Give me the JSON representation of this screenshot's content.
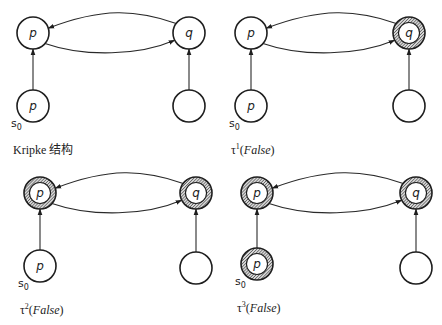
{
  "figure": {
    "panels": [
      {
        "id": "kripke",
        "caption": "Kripke 结构",
        "caption_parts": {
          "prefix": "Kripke 结构",
          "sup": "",
          "arg": ""
        },
        "origin": [
          0,
          0
        ],
        "nodes": [
          {
            "id": "s0",
            "label": "p",
            "x": 33,
            "y": 106,
            "marked": false,
            "initial": true
          },
          {
            "id": "s1",
            "label": "p",
            "x": 33,
            "y": 33,
            "marked": false
          },
          {
            "id": "s2",
            "label": "q",
            "x": 189,
            "y": 33,
            "marked": false
          },
          {
            "id": "s3",
            "label": "",
            "x": 189,
            "y": 106,
            "marked": false
          }
        ]
      },
      {
        "id": "tau1",
        "caption": "τ1(False)",
        "caption_parts": {
          "prefix": "τ",
          "sup": "1",
          "arg": "False"
        },
        "origin": [
          218,
          0
        ],
        "nodes": [
          {
            "id": "s0",
            "label": "p",
            "x": 33,
            "y": 106,
            "marked": false,
            "initial": true
          },
          {
            "id": "s1",
            "label": "p",
            "x": 33,
            "y": 33,
            "marked": false
          },
          {
            "id": "s2",
            "label": "q",
            "x": 191,
            "y": 33,
            "marked": true
          },
          {
            "id": "s3",
            "label": "",
            "x": 191,
            "y": 106,
            "marked": false
          }
        ]
      },
      {
        "id": "tau2",
        "caption": "τ2(False)",
        "caption_parts": {
          "prefix": "τ",
          "sup": "2",
          "arg": "False"
        },
        "origin": [
          0,
          160
        ],
        "nodes": [
          {
            "id": "s0",
            "label": "p",
            "x": 40,
            "y": 106,
            "marked": false,
            "initial": true
          },
          {
            "id": "s1",
            "label": "p",
            "x": 40,
            "y": 33,
            "marked": true
          },
          {
            "id": "s2",
            "label": "q",
            "x": 196,
            "y": 33,
            "marked": true
          },
          {
            "id": "s3",
            "label": "",
            "x": 196,
            "y": 108,
            "marked": false
          }
        ]
      },
      {
        "id": "tau3",
        "caption": "τ3(False)",
        "caption_parts": {
          "prefix": "τ",
          "sup": "3",
          "arg": "False"
        },
        "origin": [
          218,
          160
        ],
        "nodes": [
          {
            "id": "s0",
            "label": "p",
            "x": 39,
            "y": 104,
            "marked": true,
            "initial": true
          },
          {
            "id": "s1",
            "label": "p",
            "x": 39,
            "y": 33,
            "marked": true
          },
          {
            "id": "s2",
            "label": "q",
            "x": 198,
            "y": 33,
            "marked": true
          },
          {
            "id": "s3",
            "label": "",
            "x": 198,
            "y": 108,
            "marked": false
          }
        ]
      }
    ],
    "edges": [
      {
        "from": "s0",
        "to": "s1",
        "type": "straight"
      },
      {
        "from": "s3",
        "to": "s2",
        "type": "straight"
      },
      {
        "from": "s1",
        "to": "s2",
        "type": "curve-down"
      },
      {
        "from": "s2",
        "to": "s1",
        "type": "curve-up"
      }
    ],
    "initial_state_label": {
      "base": "s",
      "sub": "0"
    },
    "colors": {
      "stroke": "#1e1e1e",
      "hatch_dark": "#3a3a3a",
      "hatch_light": "#d8d8d8",
      "background": "#ffffff"
    },
    "node_radius": 16
  }
}
